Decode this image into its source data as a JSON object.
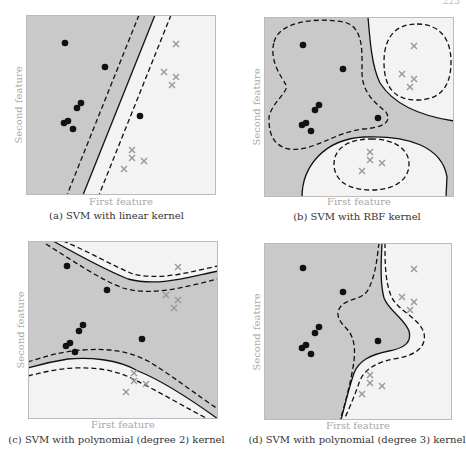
{
  "page_number": "225",
  "colors": {
    "class_a_region": "#c9c9c9",
    "class_b_region": "#f3f3f3",
    "boundary": "#111111",
    "dot": "#111111",
    "cross": "#9a9a9a",
    "frame": "#bbbbbb",
    "axis_label": "#a8a8a8",
    "caption": "#333333"
  },
  "chart_data": [
    {
      "id": "a",
      "type": "scatter",
      "title": "(a) SVM with linear kernel",
      "xlabel": "First feature",
      "ylabel": "Second feature",
      "grid": false,
      "legend": null,
      "coordinate_space": [
        190,
        180
      ],
      "series": [
        {
          "name": "class 1 (dots)",
          "marker": "circle",
          "points": [
            [
              39,
              28
            ],
            [
              79,
              52
            ],
            [
              55,
              88
            ],
            [
              51,
              93
            ],
            [
              38,
              108
            ],
            [
              42,
              106
            ],
            [
              47,
              114
            ],
            [
              114,
              101
            ]
          ]
        },
        {
          "name": "class 2 (crosses)",
          "marker": "x",
          "points": [
            [
              150,
              29
            ],
            [
              138,
              57
            ],
            [
              150,
              62
            ],
            [
              146,
              70
            ],
            [
              106,
              135
            ],
            [
              106,
              143
            ],
            [
              118,
              146
            ],
            [
              98,
              154
            ]
          ]
        }
      ],
      "dark_region_path": "M0,0 L129,0 L57,180 L0,180 Z",
      "boundaries": [
        {
          "style": "solid",
          "d": "M129,0 L57,180"
        },
        {
          "style": "dashed",
          "d": "M113,0 L41,180"
        },
        {
          "style": "dashed",
          "d": "M145,0 L73,180"
        }
      ]
    },
    {
      "id": "b",
      "type": "scatter",
      "title": "(b) SVM with RBF kernel",
      "xlabel": "First feature",
      "ylabel": "Second feature",
      "grid": false,
      "legend": null,
      "coordinate_space": [
        190,
        180
      ],
      "series": [
        {
          "name": "class 1 (dots)",
          "marker": "circle",
          "points": [
            [
              39,
              28
            ],
            [
              79,
              52
            ],
            [
              55,
              88
            ],
            [
              51,
              93
            ],
            [
              38,
              108
            ],
            [
              42,
              106
            ],
            [
              47,
              114
            ],
            [
              114,
              101
            ]
          ]
        },
        {
          "name": "class 2 (crosses)",
          "marker": "x",
          "points": [
            [
              150,
              29
            ],
            [
              138,
              57
            ],
            [
              150,
              62
            ],
            [
              146,
              70
            ],
            [
              106,
              135
            ],
            [
              106,
              143
            ],
            [
              118,
              146
            ],
            [
              98,
              154
            ]
          ]
        }
      ],
      "light_region_paths": [
        "M104,0 C106,25 108,50 116,66 C128,85 150,98 190,104 L190,0 Z",
        "M38,180 C38,150 60,122 100,120 C145,118 178,130 183,160 L182,180 Z"
      ],
      "boundaries": [
        {
          "style": "solid",
          "d": "M104,0 C106,25 108,50 116,66 C128,85 150,98 190,104"
        },
        {
          "style": "solid",
          "d": "M38,180 C38,150 60,122 100,120 C145,118 178,130 183,160 L182,180"
        },
        {
          "style": "dashed",
          "d": "M153,7 C176,7 187,22 187,45 C187,70 176,83 153,83 C130,83 120,70 120,45 C120,22 130,7 153,7 Z"
        },
        {
          "style": "dashed",
          "d": "M107,122 C132,122 145,133 145,147 C145,162 132,173 107,173 C82,173 70,162 70,147 C70,133 82,122 107,122 Z"
        },
        {
          "style": "dashed",
          "d": "M10,25 C15,5 50,0 80,5 C100,10 98,35 98,55 C98,75 110,85 122,95 C128,105 120,110 100,112 C70,115 50,135 25,132 C5,128 5,110 5,100 C8,85 25,75 22,68 C18,60 5,45 10,25 Z"
        }
      ]
    },
    {
      "id": "c",
      "type": "scatter",
      "title": "(c) SVM with polynomial (degree 2) kernel",
      "xlabel": "First feature",
      "ylabel": "Second feature",
      "grid": false,
      "legend": null,
      "coordinate_space": [
        190,
        178
      ],
      "series": [
        {
          "name": "class 1 (dots)",
          "marker": "circle",
          "points": [
            [
              39,
              25
            ],
            [
              79,
              49
            ],
            [
              55,
              84
            ],
            [
              51,
              90
            ],
            [
              38,
              105
            ],
            [
              42,
              102
            ],
            [
              47,
              111
            ],
            [
              114,
              98
            ]
          ]
        },
        {
          "name": "class 2 (crosses)",
          "marker": "x",
          "points": [
            [
              150,
              26
            ],
            [
              138,
              54
            ],
            [
              150,
              59
            ],
            [
              146,
              67
            ],
            [
              106,
              132
            ],
            [
              106,
              140
            ],
            [
              118,
              143
            ],
            [
              98,
              151
            ]
          ]
        }
      ],
      "dark_region_path": "M0,0 L25,0 C50,14 80,30 100,38 C130,46 160,36 190,30 L190,178 C165,160 135,140 110,130 C90,118 60,116 40,118 C20,121 10,124 0,127 Z",
      "boundaries": [
        {
          "style": "solid",
          "d": "M25,0 C50,14 80,30 100,38 C130,46 160,36 190,30"
        },
        {
          "style": "dashed",
          "d": "M35,0 C60,10 85,25 105,33 C135,40 165,30 190,25"
        },
        {
          "style": "dashed",
          "d": "M18,3 C45,20 75,40 95,47 C125,56 160,45 190,38"
        },
        {
          "style": "solid",
          "d": "M0,127 C10,124 20,121 40,118 C60,116 90,118 110,130 C135,140 165,160 190,178"
        },
        {
          "style": "dashed",
          "d": "M0,121 C15,116 35,110 55,109 C80,107 100,110 120,120 C145,135 170,155 190,168"
        },
        {
          "style": "dashed",
          "d": "M0,135 C15,131 30,128 45,127 C70,126 90,130 105,138 C130,150 160,168 180,178"
        }
      ]
    },
    {
      "id": "d",
      "type": "scatter",
      "title": "(d) SVM with polynomial (degree 3) kernel",
      "xlabel": "First feature",
      "ylabel": "Second feature",
      "grid": false,
      "legend": null,
      "coordinate_space": [
        188,
        177
      ],
      "series": [
        {
          "name": "class 1 (dots)",
          "marker": "circle",
          "points": [
            [
              39,
              25
            ],
            [
              79,
              49
            ],
            [
              55,
              84
            ],
            [
              51,
              90
            ],
            [
              38,
              105
            ],
            [
              42,
              102
            ],
            [
              47,
              111
            ],
            [
              114,
              98
            ]
          ]
        },
        {
          "name": "class 2 (crosses)",
          "marker": "x",
          "points": [
            [
              150,
              26
            ],
            [
              138,
              54
            ],
            [
              150,
              59
            ],
            [
              146,
              67
            ],
            [
              106,
              132
            ],
            [
              106,
              140
            ],
            [
              118,
              143
            ],
            [
              98,
              151
            ]
          ]
        }
      ],
      "dark_region_path": "M0,0 L118,0 C117,20 116,40 120,55 C125,68 140,75 145,88 C148,100 140,105 125,108 C105,112 95,118 90,130 C85,145 80,165 77,177 L0,177 Z",
      "boundaries": [
        {
          "style": "solid",
          "d": "M118,0 C117,20 116,40 120,55 C125,68 140,75 145,88 C148,100 140,105 125,108 C105,112 95,118 90,130 C85,145 80,165 77,177"
        },
        {
          "style": "dashed",
          "d": "M121,0 C121,20 121,40 128,55 C135,68 155,75 160,90 C163,105 150,112 135,115 C115,118 100,125 95,140 C90,155 83,170 80,177"
        },
        {
          "style": "dashed",
          "d": "M115,0 C113,15 112,30 105,45 C100,57 85,55 78,62 C70,70 75,78 82,85 C92,95 92,110 88,130 C84,150 80,165 76,177"
        }
      ]
    }
  ],
  "panels": [
    {
      "caption": "(a) SVM with linear kernel",
      "xlabel": "First feature",
      "ylabel": "Second feature"
    },
    {
      "caption": "(b) SVM with RBF kernel",
      "xlabel": "First feature",
      "ylabel": "Second feature"
    },
    {
      "caption": "(c) SVM with polynomial (degree 2) kernel",
      "xlabel": "First feature",
      "ylabel": "Second feature"
    },
    {
      "caption": "(d) SVM with polynomial (degree 3) kernel",
      "xlabel": "First feature",
      "ylabel": "Second feature"
    }
  ]
}
